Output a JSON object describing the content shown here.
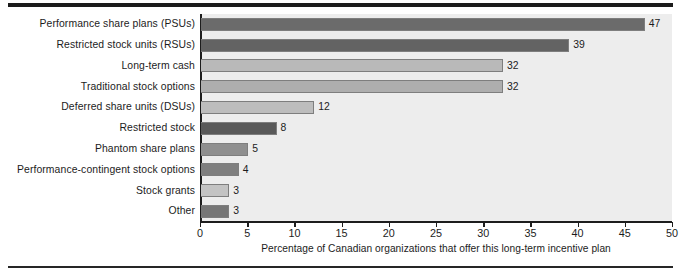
{
  "chart_data": {
    "type": "bar",
    "orientation": "horizontal",
    "title": "",
    "subtitle": "",
    "xlabel": "Percentage of Canadian organizations that offer this long-term incentive plan",
    "ylabel": "",
    "xlim": [
      0,
      50
    ],
    "xticks": [
      0,
      5,
      10,
      15,
      20,
      25,
      30,
      35,
      40,
      45,
      50
    ],
    "grid": false,
    "legend": null,
    "categories": [
      "Performance share plans (PSUs)",
      "Restricted stock units (RSUs)",
      "Long-term cash",
      "Traditional stock options",
      "Deferred share units (DSUs)",
      "Restricted stock",
      "Phantom share plans",
      "Performance-contingent stock options",
      "Stock grants",
      "Other"
    ],
    "values": [
      47,
      39,
      32,
      32,
      12,
      8,
      5,
      4,
      3,
      3
    ],
    "value_labels": [
      "47",
      "39",
      "32",
      "32",
      "12",
      "8",
      "5",
      "4",
      "3",
      "3"
    ],
    "bar_colors": [
      "#6b6b6b",
      "#636363",
      "#b9b9b9",
      "#aeaeae",
      "#bdbdbd",
      "#595959",
      "#8f8f8f",
      "#7f7f7f",
      "#c3c3c3",
      "#767676"
    ]
  },
  "style": {
    "plot_background": "#ededed",
    "page_background": "#ffffff",
    "axis_color": "#1d1d1d",
    "text_color": "#1c1c1c",
    "bar_outline": "#7e7e7e",
    "rule_color": "#1b1b1b"
  }
}
